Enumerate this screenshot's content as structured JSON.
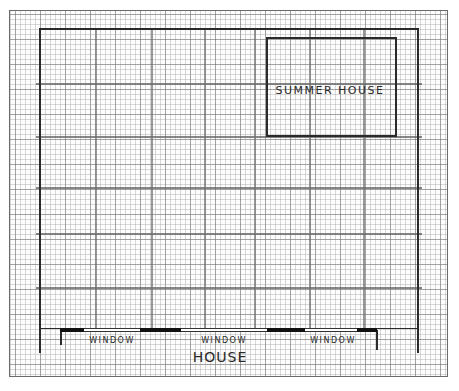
{
  "diagram": {
    "type": "hand-drawn garden plan on graph paper",
    "paper": {
      "x": 9,
      "y": 10,
      "width": 439,
      "height": 367,
      "grid_fine_px": 5,
      "grid_major_px": 25
    },
    "boundary": {
      "top_y": 28,
      "left_x": 39,
      "right_x": 417,
      "bottom_y": 353
    },
    "guide_lines": {
      "horizontal_y": [
        84,
        137,
        188,
        234,
        288
      ],
      "vertical_x": [
        96,
        152,
        205,
        255,
        310,
        364
      ]
    },
    "summer_house": {
      "label": "SUMMER HOUSE",
      "x": 266,
      "y": 37,
      "width": 131,
      "height": 100,
      "label_x": 330,
      "label_y": 90
    },
    "house": {
      "label": "HOUSE",
      "wall_y": 329,
      "left_wall_x": 60,
      "right_wall_x": 377,
      "label_x": 220,
      "label_y": 357,
      "segments": [
        {
          "kind": "wall",
          "x1": 60,
          "x2": 84
        },
        {
          "kind": "window",
          "x1": 84,
          "x2": 140,
          "label": "WINDOW",
          "label_x": 112
        },
        {
          "kind": "wall",
          "x1": 140,
          "x2": 181
        },
        {
          "kind": "window",
          "x1": 181,
          "x2": 267,
          "label": "WINDOW",
          "label_x": 224
        },
        {
          "kind": "wall",
          "x1": 267,
          "x2": 305
        },
        {
          "kind": "window",
          "x1": 305,
          "x2": 357,
          "label": "WINDOW",
          "label_x": 333
        },
        {
          "kind": "wall",
          "x1": 357,
          "x2": 377
        }
      ]
    },
    "colors": {
      "ink": "#2a2a2a",
      "wall_fill": "#111111",
      "guide_line": "#6e6e6e",
      "grid": "#aaaaaa",
      "paper": "#fdfdfd"
    }
  }
}
